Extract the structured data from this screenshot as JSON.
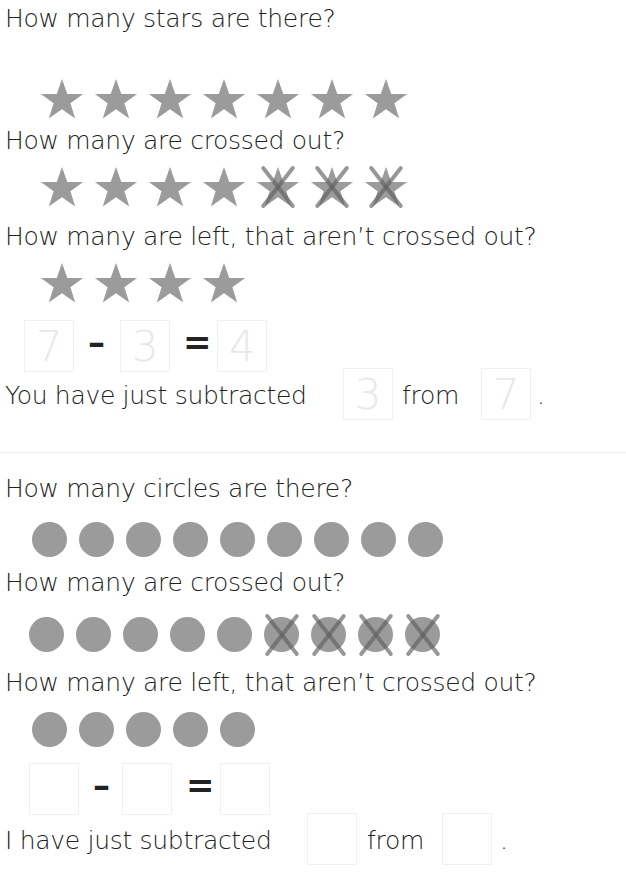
{
  "section1": {
    "q1": "How many stars are there?",
    "q2": "How many are crossed out?",
    "q3": "How many are left, that aren’t crossed out?",
    "total_shapes": 7,
    "crossed": 3,
    "remaining": 4,
    "equation": {
      "a": "7",
      "minus": "–",
      "b": "3",
      "equals": "=",
      "c": "4"
    },
    "sentence": {
      "prefix": "You have just subtracted",
      "box1": "3",
      "middle": "from",
      "box2": "7",
      "suffix": "."
    }
  },
  "section2": {
    "q1": "How many circles are there?",
    "q2": "How many are crossed out?",
    "q3": "How many are left, that aren’t crossed out?",
    "total_shapes": 9,
    "crossed": 4,
    "remaining": 5,
    "equation": {
      "a": "",
      "minus": "–",
      "b": "",
      "equals": "=",
      "c": ""
    },
    "sentence": {
      "prefix": "I have just subtracted",
      "box1": "",
      "middle": "from",
      "box2": "",
      "suffix": "."
    }
  },
  "colors": {
    "shape": "#9b9b9b",
    "cross": "#5f5f5f",
    "text": "#222222",
    "box_border": "#f0f0f0"
  }
}
